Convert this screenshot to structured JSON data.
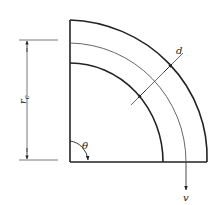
{
  "diagram": {
    "type": "quarter-annulus pipe bend schematic",
    "labels": {
      "radius": "r",
      "radius_subscript": "c",
      "angle": "θ",
      "width": "d",
      "velocity": "v"
    },
    "colors": {
      "stroke": "#222222",
      "thin_stroke": "#555555",
      "background": "#ffffff"
    }
  }
}
